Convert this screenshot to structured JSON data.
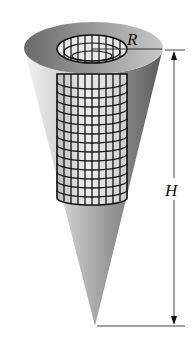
{
  "figure": {
    "labels": {
      "radius": "R",
      "height": "H"
    },
    "colors": {
      "cone_light": "#e6e6e6",
      "cone_dark": "#6e6e6e",
      "rim_top": "#8a8a8a",
      "grid_line": "#111111",
      "dimension_line": "#444444"
    }
  }
}
